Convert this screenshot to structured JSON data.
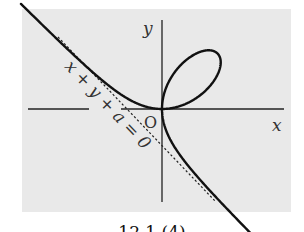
{
  "figure": {
    "equation": "x^3 + y^3 = 3axy",
    "curve_name": "folium",
    "axis_labels": {
      "x": "x",
      "y": "y",
      "origin": "O"
    },
    "asymptote_label": "x + y + a = 0",
    "caption": "12.1 (4)"
  },
  "layout": {
    "origin_px": [
      162,
      109
    ],
    "a_px": 37,
    "panel": [
      22,
      9,
      269,
      203
    ],
    "colors": {
      "panel": "#e9e9e9",
      "curve": "#111111",
      "axis": "#222222"
    }
  }
}
